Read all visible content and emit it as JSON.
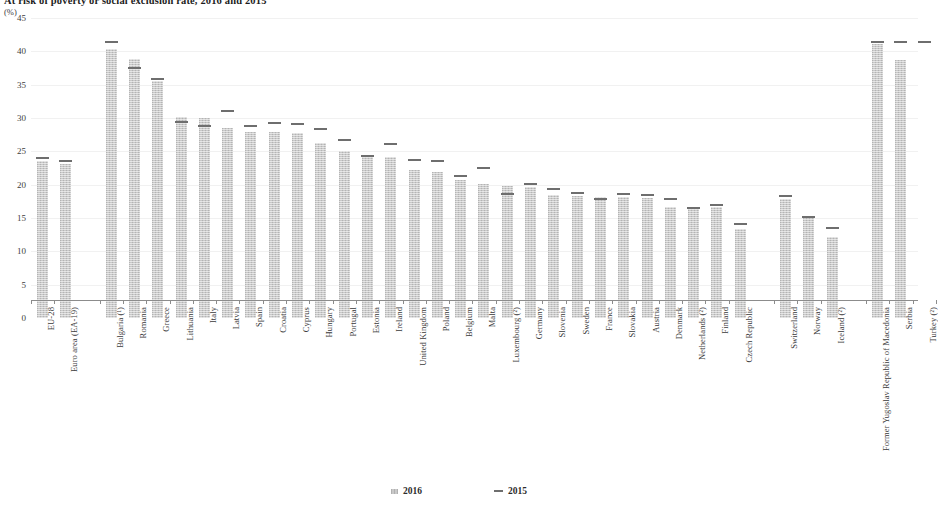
{
  "title": "At risk of poverty or social exclusion rate, 2016 and 2015",
  "unit": "(%)",
  "legend": {
    "items": [
      {
        "label": "2016",
        "marker": "bar",
        "color": "#c9c9c9"
      },
      {
        "label": "2015",
        "marker": "dash",
        "color": "#6e6e6e"
      }
    ]
  },
  "chart_data": {
    "type": "bar",
    "title": "At risk of poverty or social exclusion rate, 2016 and 2015",
    "subtitle": "(%)",
    "xlabel": "",
    "ylabel": "(%)",
    "ylim": [
      0,
      45
    ],
    "yticks": [
      0,
      5,
      10,
      15,
      20,
      25,
      30,
      35,
      40,
      45
    ],
    "grid": true,
    "legend_position": "bottom",
    "categories": [
      "EU-28",
      "Euro area (EA-19)",
      "Bulgaria (¹)",
      "Romania",
      "Greece",
      "Lithuania",
      "Italy",
      "Latvia",
      "Spain",
      "Croatia",
      "Cyprus",
      "Hungary",
      "Portugal",
      "Estonia",
      "Ireland",
      "United Kingdom",
      "Poland",
      "Belgium",
      "Malta",
      "Luxembourg (²)",
      "Germany",
      "Slovenia",
      "Sweden",
      "France",
      "Slovakia",
      "Austria",
      "Denmark",
      "Netherlands (²)",
      "Finland",
      "Czech Republic",
      "Switzerland",
      "Norway",
      "Iceland (²)",
      "Former Yugoslav Republic of Macedonia",
      "Serbia",
      "Turkey (²)"
    ],
    "series": [
      {
        "name": "2016",
        "values": [
          23.5,
          23.1,
          40.4,
          38.8,
          35.6,
          30.1,
          30.0,
          28.5,
          27.9,
          27.9,
          27.7,
          26.3,
          25.1,
          24.4,
          24.2,
          22.2,
          21.9,
          20.7,
          20.1,
          19.8,
          19.7,
          18.4,
          18.3,
          18.2,
          18.1,
          18.0,
          16.7,
          16.7,
          16.6,
          13.3,
          17.8,
          15.3,
          12.2,
          41.1,
          38.7,
          null
        ]
      },
      {
        "name": "2015",
        "values": [
          23.8,
          23.4,
          41.3,
          37.4,
          35.7,
          29.3,
          28.7,
          30.9,
          28.6,
          29.1,
          28.9,
          28.2,
          26.6,
          24.2,
          26.0,
          23.5,
          23.4,
          21.1,
          22.4,
          18.5,
          20.0,
          19.2,
          18.6,
          17.7,
          18.4,
          18.3,
          17.7,
          16.4,
          16.8,
          14.0,
          18.2,
          15.0,
          13.4,
          41.3,
          41.3,
          41.3
        ]
      }
    ],
    "group_gaps_after": [
      1,
      29,
      32
    ],
    "notes": [
      "¹ Bulgaria",
      "² Provisional"
    ]
  }
}
